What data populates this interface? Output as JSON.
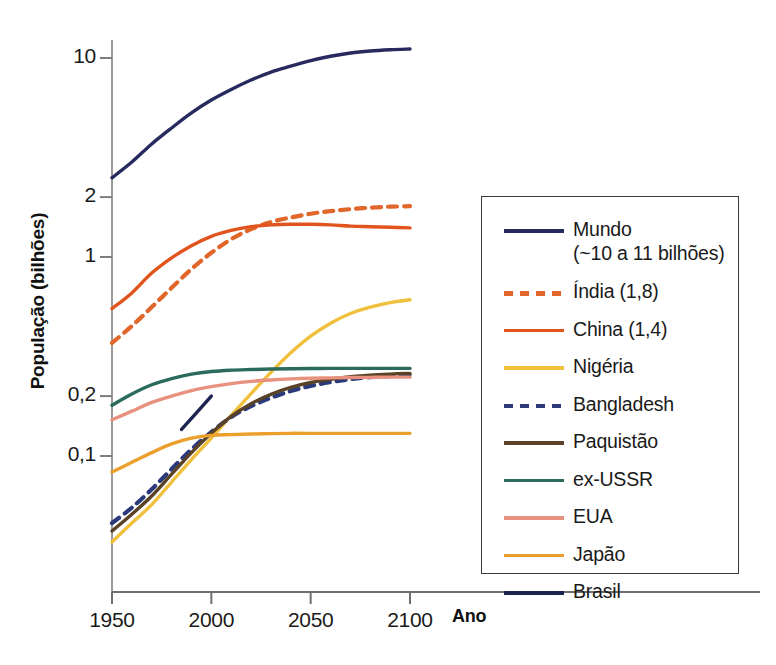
{
  "chart_data": {
    "type": "line",
    "title": "",
    "xlabel": "Ano",
    "ylabel": "População (bilhões)",
    "x_ticks": [
      1950,
      2000,
      2050,
      2100
    ],
    "x_tick_labels": [
      "1950",
      "2000",
      "2050",
      "2100"
    ],
    "xlim": [
      1950,
      2100
    ],
    "y_scale": "log",
    "y_ticks": [
      0.1,
      0.2,
      1,
      2,
      10
    ],
    "y_tick_labels": [
      "0,1",
      "0,2",
      "1",
      "2",
      "10"
    ],
    "ylim": [
      0.04,
      13
    ],
    "grid": false,
    "legend_position": "right",
    "x": [
      1950,
      1960,
      1970,
      1980,
      1990,
      2000,
      2010,
      2020,
      2030,
      2040,
      2050,
      2060,
      2070,
      2080,
      2090,
      2100
    ],
    "series": [
      {
        "name": "Mundo",
        "label": "Mundo\n(~10 a 11 bilhões)",
        "color": "#262a5e",
        "style": "solid",
        "values": [
          2.5,
          3.0,
          3.7,
          4.45,
          5.3,
          6.15,
          6.95,
          7.75,
          8.5,
          9.1,
          9.7,
          10.2,
          10.6,
          10.85,
          11.0,
          11.1
        ]
      },
      {
        "name": "Índia",
        "label": "Índia (1,8)",
        "color": "#e0662a",
        "style": "dashed",
        "values": [
          0.37,
          0.45,
          0.56,
          0.7,
          0.87,
          1.05,
          1.23,
          1.38,
          1.5,
          1.58,
          1.65,
          1.7,
          1.74,
          1.77,
          1.79,
          1.8
        ]
      },
      {
        "name": "China",
        "label": "China (1,4)",
        "color": "#e2541d",
        "style": "solid",
        "values": [
          0.55,
          0.66,
          0.83,
          0.99,
          1.14,
          1.27,
          1.36,
          1.42,
          1.45,
          1.46,
          1.46,
          1.45,
          1.43,
          1.42,
          1.41,
          1.4
        ]
      },
      {
        "name": "Nigéria",
        "label": "Nigéria",
        "color": "#f0c03c",
        "style": "solid",
        "values": [
          0.037,
          0.046,
          0.057,
          0.074,
          0.096,
          0.123,
          0.16,
          0.206,
          0.263,
          0.33,
          0.4,
          0.465,
          0.52,
          0.56,
          0.59,
          0.61
        ]
      },
      {
        "name": "Bangladesh",
        "label": "Bangladesh",
        "color": "#2b3a7a",
        "style": "dashed",
        "values": [
          0.046,
          0.055,
          0.068,
          0.086,
          0.108,
          0.132,
          0.157,
          0.178,
          0.196,
          0.212,
          0.225,
          0.235,
          0.243,
          0.249,
          0.253,
          0.256
        ]
      },
      {
        "name": "Paquistão",
        "label": "Paquistão",
        "color": "#5a4226",
        "style": "solid",
        "values": [
          0.042,
          0.051,
          0.063,
          0.081,
          0.104,
          0.13,
          0.158,
          0.183,
          0.204,
          0.221,
          0.234,
          0.243,
          0.25,
          0.255,
          0.258,
          0.26
        ]
      },
      {
        "name": "ex-USSR",
        "label": "ex-USSR",
        "color": "#2a6b5e",
        "style": "solid",
        "values": [
          0.18,
          0.205,
          0.228,
          0.245,
          0.258,
          0.266,
          0.27,
          0.272,
          0.2735,
          0.2745,
          0.275,
          0.2755,
          0.2755,
          0.2755,
          0.2755,
          0.2755
        ]
      },
      {
        "name": "EUA",
        "label": "EUA",
        "color": "#e8917f",
        "style": "solid",
        "values": [
          0.152,
          0.168,
          0.186,
          0.2,
          0.213,
          0.223,
          0.231,
          0.237,
          0.241,
          0.244,
          0.246,
          0.247,
          0.248,
          0.2485,
          0.249,
          0.249
        ]
      },
      {
        "name": "Japão",
        "label": "Japão",
        "color": "#eba02e",
        "style": "solid",
        "values": [
          0.083,
          0.093,
          0.104,
          0.115,
          0.123,
          0.127,
          0.128,
          0.129,
          0.1295,
          0.13,
          0.13,
          0.13,
          0.13,
          0.13,
          0.13,
          0.13
        ]
      },
      {
        "name": "Brasil",
        "label": "Brasil",
        "color": "#1d2350",
        "style": "solid",
        "partial": true,
        "x_partial": [
          1985,
          2000
        ],
        "values_partial": [
          0.136,
          0.2
        ]
      }
    ]
  },
  "axis": {
    "y_title": "População (bilhões)",
    "x_title": "Ano"
  }
}
